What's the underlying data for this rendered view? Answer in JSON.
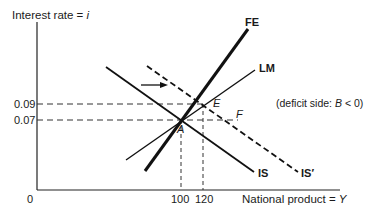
{
  "diagram": {
    "y_axis_label": "Interest rate = ",
    "y_axis_var": "i",
    "x_axis_label": "National product = ",
    "x_axis_var": "Y",
    "origin_label": "0",
    "y_ticks": [
      {
        "label": "0.09",
        "value": 0.09
      },
      {
        "label": "0.07",
        "value": 0.07
      }
    ],
    "x_ticks": [
      {
        "label": "100",
        "value": 100
      },
      {
        "label": "120",
        "value": 120
      }
    ],
    "curves": {
      "fe": "FE",
      "lm": "LM",
      "is": "IS",
      "is_prime": "IS′"
    },
    "points": {
      "a": "A",
      "e": "E",
      "f": "F"
    },
    "annotation": {
      "prefix": "(deficit side: ",
      "var": "B",
      "suffix": " < 0)"
    }
  }
}
